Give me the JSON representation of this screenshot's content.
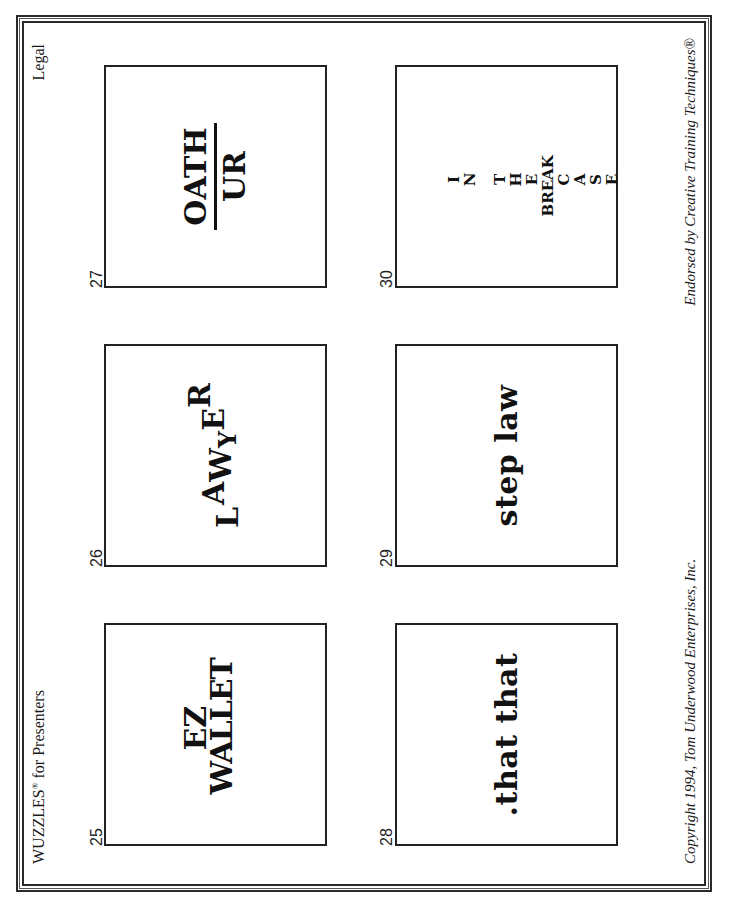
{
  "header": {
    "title_main": "WUZZLES",
    "title_mark": "®",
    "title_rest": " for Presenters",
    "category": "Legal"
  },
  "footer": {
    "copyright": "Copyright 1994, Tom Underwood Enterprises, Inc.",
    "endorsement": "Endorsed by Creative Training Techniques®"
  },
  "puzzles": [
    {
      "number": "25",
      "lines": [
        "EZ",
        "WALLET"
      ]
    },
    {
      "number": "26",
      "letters": [
        "L",
        "A",
        "W",
        "Y",
        "E",
        "R"
      ]
    },
    {
      "number": "27",
      "numerator": "OATH",
      "denominator": "UR"
    },
    {
      "number": "28",
      "text": ".that that"
    },
    {
      "number": "29",
      "text": "step law"
    },
    {
      "number": "30",
      "vertical_letters": [
        "I",
        "N",
        "",
        "T",
        "H",
        "E",
        "",
        "C",
        "A",
        "S",
        "E"
      ],
      "crossing_word": "BREAK"
    }
  ],
  "colors": {
    "ink": "#1a1a1a",
    "paper": "#ffffff"
  }
}
